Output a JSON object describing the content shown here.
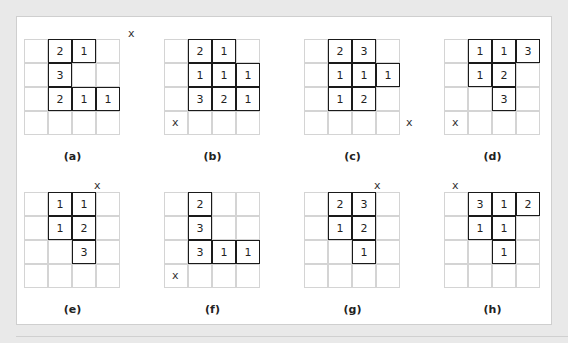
{
  "figures": [
    {
      "id": "a",
      "label": "(a)",
      "cells": [
        [
          0,
          1,
          "2"
        ],
        [
          0,
          2,
          "1"
        ],
        [
          1,
          1,
          "3"
        ],
        [
          2,
          1,
          "2"
        ],
        [
          2,
          2,
          "1"
        ],
        [
          2,
          3,
          "1"
        ]
      ],
      "x_mark": {
        "text": "x",
        "row": -1,
        "col": 4
      }
    },
    {
      "id": "b",
      "label": "(b)",
      "cells": [
        [
          0,
          1,
          "2"
        ],
        [
          0,
          2,
          "1"
        ],
        [
          1,
          1,
          "1"
        ],
        [
          1,
          2,
          "1"
        ],
        [
          1,
          3,
          "1"
        ],
        [
          2,
          1,
          "3"
        ],
        [
          2,
          2,
          "2"
        ],
        [
          2,
          3,
          "1"
        ]
      ],
      "x_mark": {
        "text": "x",
        "row": 3,
        "col": 0
      }
    },
    {
      "id": "c",
      "label": "(c)",
      "cells": [
        [
          0,
          1,
          "2"
        ],
        [
          0,
          2,
          "3"
        ],
        [
          1,
          1,
          "1"
        ],
        [
          1,
          2,
          "1"
        ],
        [
          1,
          3,
          "1"
        ],
        [
          2,
          1,
          "1"
        ],
        [
          2,
          2,
          "2"
        ]
      ],
      "x_mark": {
        "text": "x",
        "row": 3,
        "col": 4
      }
    },
    {
      "id": "d",
      "label": "(d)",
      "cells": [
        [
          0,
          1,
          "1"
        ],
        [
          0,
          2,
          "1"
        ],
        [
          0,
          3,
          "3"
        ],
        [
          1,
          1,
          "1"
        ],
        [
          1,
          2,
          "2"
        ],
        [
          2,
          2,
          "3"
        ]
      ],
      "x_mark": {
        "text": "x",
        "row": 3,
        "col": 0
      }
    },
    {
      "id": "e",
      "label": "(e)",
      "cells": [
        [
          0,
          1,
          "1"
        ],
        [
          0,
          2,
          "1"
        ],
        [
          1,
          1,
          "1"
        ],
        [
          1,
          2,
          "2"
        ],
        [
          2,
          2,
          "3"
        ]
      ],
      "x_mark": {
        "text": "x",
        "row": -1,
        "col": 3
      }
    },
    {
      "id": "f",
      "label": "(f)",
      "cells": [
        [
          0,
          1,
          "2"
        ],
        [
          1,
          1,
          "3"
        ],
        [
          2,
          1,
          "3"
        ],
        [
          2,
          2,
          "1"
        ],
        [
          2,
          3,
          "1"
        ]
      ],
      "x_mark": {
        "text": "x",
        "row": 3,
        "col": 0
      }
    },
    {
      "id": "g",
      "label": "(g)",
      "cells": [
        [
          0,
          1,
          "2"
        ],
        [
          0,
          2,
          "3"
        ],
        [
          1,
          1,
          "1"
        ],
        [
          1,
          2,
          "2"
        ],
        [
          2,
          2,
          "1"
        ]
      ],
      "x_mark": {
        "text": "x",
        "row": -1,
        "col": 3
      }
    },
    {
      "id": "h",
      "label": "(h)",
      "cells": [
        [
          0,
          1,
          "3"
        ],
        [
          0,
          2,
          "1"
        ],
        [
          0,
          3,
          "2"
        ],
        [
          1,
          1,
          "1"
        ],
        [
          1,
          2,
          "1"
        ],
        [
          2,
          2,
          "1"
        ]
      ],
      "x_mark": {
        "text": "x",
        "row": -1,
        "col": 0
      }
    }
  ]
}
